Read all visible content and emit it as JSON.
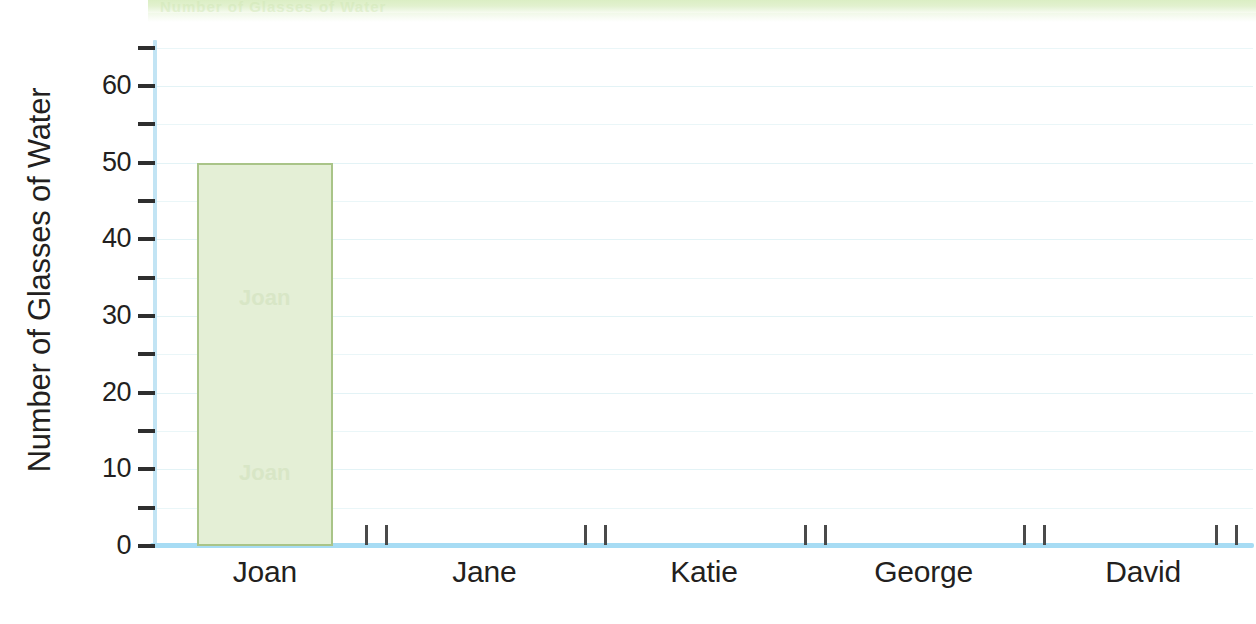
{
  "banner": {
    "ghost_text": "Number of Glasses of Water"
  },
  "chart_data": {
    "type": "bar",
    "title": "",
    "xlabel": "",
    "ylabel": "Number of Glasses of Water",
    "categories": [
      "Joan",
      "Jane",
      "Katie",
      "George",
      "David"
    ],
    "values": [
      50,
      0,
      0,
      0,
      0
    ],
    "ylim": [
      0,
      66
    ],
    "y_major_ticks": [
      0,
      10,
      20,
      30,
      40,
      50,
      60
    ],
    "y_major_tick_labels": [
      "0",
      "10",
      "20",
      "30",
      "40",
      "50",
      "60"
    ],
    "y_minor_ticks": [
      5,
      15,
      25,
      35,
      45,
      55,
      65
    ],
    "grid": true,
    "legend": "none",
    "bar_fill_color": "#e4efd6",
    "bar_border_color": "#a9c488",
    "axis_color": "#a7dcf4",
    "gridline_color": "#eaf6f8",
    "text_color": "#231f20",
    "bar_ghost_labels": [
      "Joan",
      ""
    ]
  }
}
